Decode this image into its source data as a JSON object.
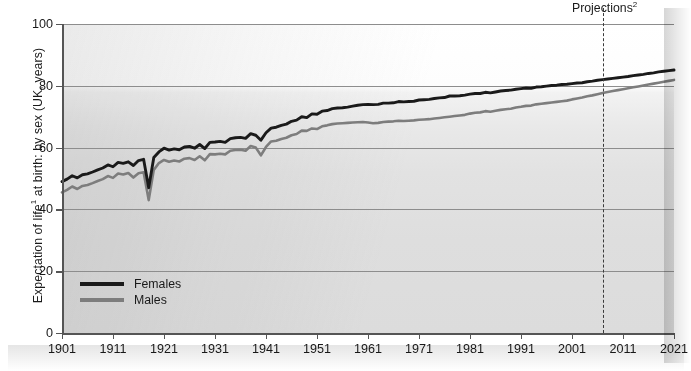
{
  "chart_data": {
    "type": "line",
    "title": "",
    "ylabel": "Expectation of life¹ at birth: by sex (UK, years)",
    "ylabel_main": "Expectation of life",
    "ylabel_sup": "1",
    "ylabel_rest": " at birth: by sex (UK, years)",
    "xlabel": "",
    "ylim": [
      0,
      100
    ],
    "xlim": [
      1901,
      2021
    ],
    "yticks": [
      0,
      20,
      40,
      60,
      80,
      100
    ],
    "ytick_labels": [
      "0",
      "20",
      "40",
      "60",
      "80",
      "100"
    ],
    "xticks": [
      1901,
      1911,
      1921,
      1931,
      1941,
      1951,
      1961,
      1971,
      1981,
      1991,
      2001,
      2011,
      2021
    ],
    "xtick_labels": [
      "1901",
      "1911",
      "1921",
      "1931",
      "1941",
      "1951",
      "1961",
      "1971",
      "1981",
      "1991",
      "2001",
      "2011",
      "2021"
    ],
    "grid": true,
    "grid_axis": "y",
    "legend_position": "bottom-left",
    "annotations": [
      {
        "name": "projections-divider",
        "text": "Projections²",
        "text_main": "Projections",
        "text_sup": "2",
        "x": 2007,
        "style": "dashed-vertical-line"
      }
    ],
    "colors": {
      "females": "#1a1a1a",
      "males": "#7d7d7d",
      "grid": "#8d8d8d",
      "axis": "#555555",
      "plot_background_top": "#ffffff",
      "plot_background_bottom": "#dcdcdc"
    },
    "x": [
      1901,
      1902,
      1903,
      1904,
      1905,
      1906,
      1907,
      1908,
      1909,
      1910,
      1911,
      1912,
      1913,
      1914,
      1915,
      1916,
      1917,
      1918,
      1919,
      1920,
      1921,
      1922,
      1923,
      1924,
      1925,
      1926,
      1927,
      1928,
      1929,
      1930,
      1931,
      1932,
      1933,
      1934,
      1935,
      1936,
      1937,
      1938,
      1939,
      1940,
      1941,
      1942,
      1943,
      1944,
      1945,
      1946,
      1947,
      1948,
      1949,
      1950,
      1951,
      1952,
      1953,
      1954,
      1955,
      1956,
      1957,
      1958,
      1959,
      1960,
      1961,
      1962,
      1963,
      1964,
      1965,
      1966,
      1967,
      1968,
      1969,
      1970,
      1971,
      1972,
      1973,
      1974,
      1975,
      1976,
      1977,
      1978,
      1979,
      1980,
      1981,
      1982,
      1983,
      1984,
      1985,
      1986,
      1987,
      1988,
      1989,
      1990,
      1991,
      1992,
      1993,
      1994,
      1995,
      1996,
      1997,
      1998,
      1999,
      2000,
      2001,
      2002,
      2003,
      2004,
      2005,
      2006,
      2007,
      2008,
      2009,
      2010,
      2011,
      2012,
      2013,
      2014,
      2015,
      2016,
      2017,
      2018,
      2019,
      2020,
      2021
    ],
    "series": [
      {
        "name": "Females",
        "color": "#1a1a1a",
        "values": [
          49.0,
          49.8,
          50.9,
          50.2,
          51.2,
          51.5,
          52.1,
          52.8,
          53.4,
          54.4,
          53.8,
          55.2,
          54.9,
          55.4,
          54.2,
          55.8,
          56.2,
          47.0,
          56.8,
          58.6,
          59.8,
          59.2,
          59.6,
          59.3,
          60.2,
          60.4,
          59.8,
          61.0,
          59.7,
          61.7,
          61.8,
          62.0,
          61.7,
          62.9,
          63.2,
          63.3,
          63.0,
          64.5,
          64.0,
          62.4,
          64.8,
          66.3,
          66.6,
          67.2,
          67.6,
          68.5,
          68.9,
          70.0,
          69.7,
          70.9,
          70.8,
          71.8,
          72.0,
          72.6,
          72.8,
          72.9,
          73.1,
          73.4,
          73.7,
          73.9,
          74.0,
          73.9,
          74.0,
          74.4,
          74.4,
          74.5,
          74.9,
          74.8,
          74.9,
          75.0,
          75.4,
          75.5,
          75.6,
          75.9,
          76.1,
          76.2,
          76.7,
          76.7,
          76.8,
          77.0,
          77.3,
          77.5,
          77.5,
          77.9,
          77.7,
          78.0,
          78.3,
          78.5,
          78.6,
          78.9,
          79.1,
          79.3,
          79.2,
          79.6,
          79.7,
          79.9,
          80.1,
          80.2,
          80.4,
          80.5,
          80.7,
          80.9,
          81.0,
          81.3,
          81.5,
          81.8,
          82.0,
          82.2,
          82.4,
          82.6,
          82.8,
          83.0,
          83.3,
          83.5,
          83.7,
          84.0,
          84.2,
          84.5,
          84.7,
          84.9,
          85.1
        ],
        "note": "near-black solid line"
      },
      {
        "name": "Males",
        "color": "#7d7d7d",
        "values": [
          45.5,
          46.3,
          47.4,
          46.6,
          47.6,
          47.9,
          48.5,
          49.2,
          49.8,
          50.8,
          50.2,
          51.6,
          51.3,
          51.8,
          50.3,
          51.7,
          52.0,
          43.0,
          52.8,
          55.0,
          56.0,
          55.4,
          55.8,
          55.5,
          56.4,
          56.6,
          56.0,
          57.2,
          55.9,
          57.9,
          57.8,
          58.0,
          57.8,
          59.0,
          59.2,
          59.3,
          59.0,
          60.5,
          60.0,
          57.5,
          60.2,
          62.0,
          62.2,
          62.8,
          63.2,
          64.0,
          64.4,
          65.5,
          65.4,
          66.2,
          66.0,
          66.9,
          67.2,
          67.6,
          67.8,
          67.9,
          68.0,
          68.1,
          68.2,
          68.3,
          68.1,
          67.9,
          68.0,
          68.3,
          68.4,
          68.5,
          68.7,
          68.6,
          68.7,
          68.8,
          69.0,
          69.1,
          69.2,
          69.4,
          69.6,
          69.8,
          70.0,
          70.2,
          70.4,
          70.6,
          71.0,
          71.3,
          71.4,
          71.8,
          71.6,
          71.9,
          72.2,
          72.4,
          72.6,
          73.0,
          73.2,
          73.5,
          73.6,
          74.0,
          74.2,
          74.4,
          74.6,
          74.8,
          75.0,
          75.2,
          75.6,
          75.9,
          76.2,
          76.6,
          76.9,
          77.3,
          77.7,
          78.0,
          78.3,
          78.6,
          78.9,
          79.2,
          79.5,
          79.8,
          80.1,
          80.4,
          80.7,
          81.0,
          81.3,
          81.6,
          81.9
        ],
        "note": "medium grey solid line"
      }
    ]
  },
  "legend": {
    "items": [
      {
        "label": "Females",
        "color": "#1a1a1a"
      },
      {
        "label": "Males",
        "color": "#7d7d7d"
      }
    ]
  }
}
